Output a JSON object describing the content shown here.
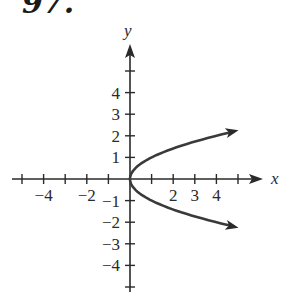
{
  "problem_number": "97.",
  "chart_data": {
    "type": "line",
    "title": "",
    "equation_depicted": "x = y^2",
    "xlabel": "x",
    "ylabel": "y",
    "x_tick_labels": [
      "-4",
      "-2",
      "2",
      "3",
      "4"
    ],
    "y_tick_labels": [
      "4",
      "3",
      "2",
      "1",
      "-1",
      "-2",
      "-3",
      "-4"
    ],
    "xlim": [
      -5,
      6
    ],
    "ylim": [
      -5,
      6
    ],
    "grid": false,
    "series": [
      {
        "name": "curve",
        "color": "#3a3a3a",
        "points": [
          {
            "x": 5,
            "y": 2.24
          },
          {
            "x": 4,
            "y": 2
          },
          {
            "x": 2.25,
            "y": 1.5
          },
          {
            "x": 1,
            "y": 1
          },
          {
            "x": 0.25,
            "y": 0.5
          },
          {
            "x": 0,
            "y": 0
          },
          {
            "x": 0.25,
            "y": -0.5
          },
          {
            "x": 1,
            "y": -1
          },
          {
            "x": 2.25,
            "y": -1.5
          },
          {
            "x": 4,
            "y": -2
          },
          {
            "x": 5,
            "y": -2.24
          }
        ],
        "arrows_at_ends": true
      }
    ]
  }
}
